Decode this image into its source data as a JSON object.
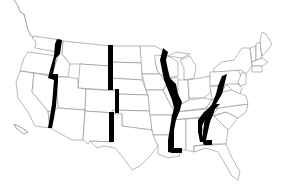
{
  "map": {
    "title": "United States state outline map",
    "subject": "Contiguous United States with highlighted north-south state boundaries",
    "colors": {
      "background": "#ffffff",
      "state_fill": "#ffffff",
      "state_border": "#8a8a8a",
      "highlight": "#000000"
    },
    "highlighted_boundaries": [
      {
        "id": "west",
        "label": "Idaho/Nevada western boundary (OR-ID, NV-CA)"
      },
      {
        "id": "rockies",
        "label": "Montana/Wyoming/Colorado - Dakotas/Nebraska/Kansas boundary"
      },
      {
        "id": "mississippi",
        "label": "Mississippi River boundary"
      },
      {
        "id": "appalachian",
        "label": "Ohio/Kentucky/Tennessee/Alabama eastern boundary"
      },
      {
        "id": "southeast",
        "label": "Alabama-Georgia boundary"
      }
    ],
    "labels": []
  }
}
